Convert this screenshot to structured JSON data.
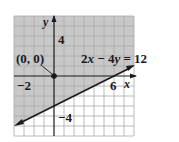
{
  "graph": {
    "equation": {
      "parts": [
        "2",
        "x",
        " − 4",
        "y",
        " = 12"
      ]
    },
    "point_label": "(0, 0)",
    "axis_labels": {
      "x": "x",
      "y": "y"
    },
    "tick_labels": {
      "y_pos": "4",
      "x_neg": "−2",
      "x_pos": "6",
      "y_neg": "−4"
    },
    "grid": {
      "x_min": -4,
      "x_max": 8,
      "y_min": -6,
      "y_max": 6,
      "step": 1
    },
    "shaded_region": "above line (contains origin)",
    "colors": {
      "shade": "#c8c8c8",
      "grid_shaded": "#9a9a9a",
      "grid_unshaded": "#b0b0b0",
      "ink": "#1a1a1a"
    }
  }
}
